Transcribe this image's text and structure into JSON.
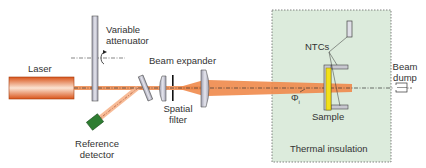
{
  "labels": {
    "laser": "Laser",
    "variable_attenuator_line1": "Variable",
    "variable_attenuator_line2": "attenuator",
    "beam_expander": "Beam expander",
    "spatial_filter_line1": "Spatial",
    "spatial_filter_line2": "filter",
    "reference_detector_line1": "Reference",
    "reference_detector_line2": "detector",
    "ntcs": "NTCs",
    "sample": "Sample",
    "phi": "Φ",
    "phi_sub": "i",
    "thermal_insulation": "Thermal insulation",
    "beam_dump_line1": "Beam",
    "beam_dump_line2": "dump"
  },
  "colors": {
    "beam": "#f08a4b",
    "laser_body": "#e8692a",
    "insulation_fill": "#dcebdc",
    "sample": "#f2e01a",
    "detector": "#2e7d32",
    "optic": "#c8c8d0"
  }
}
